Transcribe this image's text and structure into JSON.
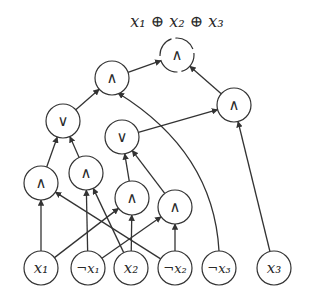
{
  "title": "x₁ ⊕ x₂ ⊕ x₃",
  "colors": {
    "stroke": "#333333",
    "text": "#2a2a2a",
    "background": "#ffffff"
  },
  "node_radius": 17,
  "nodes": [
    {
      "id": "out",
      "label": "∧",
      "x": 177,
      "y": 55,
      "type": "and",
      "dashed": true
    },
    {
      "id": "a1",
      "label": "∧",
      "x": 112,
      "y": 78,
      "type": "and"
    },
    {
      "id": "a2",
      "label": "∧",
      "x": 234,
      "y": 105,
      "type": "and"
    },
    {
      "id": "o1",
      "label": "∨",
      "x": 63,
      "y": 121,
      "type": "or"
    },
    {
      "id": "o2",
      "label": "∨",
      "x": 122,
      "y": 137,
      "type": "or"
    },
    {
      "id": "b1",
      "label": "∧",
      "x": 41,
      "y": 183,
      "type": "and"
    },
    {
      "id": "b2",
      "label": "∧",
      "x": 86,
      "y": 173,
      "type": "and"
    },
    {
      "id": "b3",
      "label": "∧",
      "x": 132,
      "y": 198,
      "type": "and"
    },
    {
      "id": "b4",
      "label": "∧",
      "x": 175,
      "y": 207,
      "type": "and"
    },
    {
      "id": "x1",
      "label": "x₁",
      "x": 41,
      "y": 268,
      "type": "input"
    },
    {
      "id": "nx1",
      "label": "¬x₁",
      "x": 88,
      "y": 268,
      "type": "input"
    },
    {
      "id": "x2",
      "label": "x₂",
      "x": 131,
      "y": 268,
      "type": "input"
    },
    {
      "id": "nx2",
      "label": "¬x₂",
      "x": 175,
      "y": 268,
      "type": "input"
    },
    {
      "id": "nx3",
      "label": "¬x₃",
      "x": 219,
      "y": 268,
      "type": "input"
    },
    {
      "id": "x3",
      "label": "x₃",
      "x": 274,
      "y": 268,
      "type": "input"
    }
  ],
  "edges": [
    {
      "from": "a1",
      "to": "out"
    },
    {
      "from": "a2",
      "to": "out"
    },
    {
      "from": "o1",
      "to": "a1"
    },
    {
      "from": "nx3",
      "to": "a1",
      "curved": true
    },
    {
      "from": "o2",
      "to": "a2"
    },
    {
      "from": "x3",
      "to": "a2"
    },
    {
      "from": "b1",
      "to": "o1"
    },
    {
      "from": "b2",
      "to": "o1"
    },
    {
      "from": "b3",
      "to": "o2"
    },
    {
      "from": "b4",
      "to": "o2"
    },
    {
      "from": "x1",
      "to": "b1"
    },
    {
      "from": "nx2",
      "to": "b1"
    },
    {
      "from": "nx1",
      "to": "b2"
    },
    {
      "from": "x2",
      "to": "b2"
    },
    {
      "from": "x1",
      "to": "b3"
    },
    {
      "from": "x2",
      "to": "b3"
    },
    {
      "from": "nx1",
      "to": "b4"
    },
    {
      "from": "nx2",
      "to": "b4"
    }
  ]
}
